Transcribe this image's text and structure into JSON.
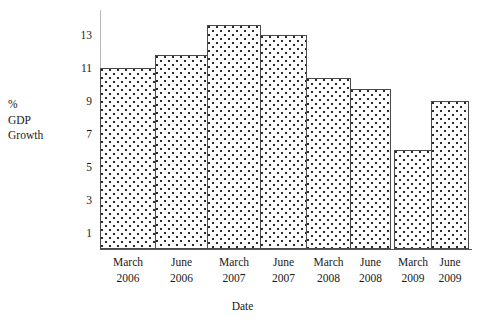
{
  "chart_data": {
    "type": "bar",
    "title": "",
    "xlabel": "Date",
    "ylabel": "% GDP Growth",
    "ylabel_lines": [
      "%",
      "GDP",
      "Growth"
    ],
    "categories": [
      "March 2006",
      "June 2006",
      "March 2007",
      "June 2007",
      "March 2008",
      "June 2008",
      "March 2009",
      "June 2009"
    ],
    "category_lines": [
      [
        "March",
        "2006"
      ],
      [
        "June",
        "2006"
      ],
      [
        "March",
        "2007"
      ],
      [
        "June",
        "2007"
      ],
      [
        "March",
        "2008"
      ],
      [
        "June",
        "2008"
      ],
      [
        "March",
        "2009"
      ],
      [
        "June",
        "2009"
      ]
    ],
    "values": [
      11.0,
      11.8,
      13.6,
      13.0,
      10.4,
      9.7,
      6.0,
      9.0
    ],
    "ytick_labels": [
      "13",
      "11",
      "9",
      "7",
      "5",
      "3",
      "1"
    ],
    "ytick_values": [
      13,
      11,
      9,
      7,
      5,
      3,
      1
    ],
    "ylim": [
      0,
      14.5
    ],
    "grid": false,
    "legend": "none",
    "bar_fill": "#fdfdfd",
    "bar_dot_color": "#2b2b2b",
    "bar_border": "#4a4a4a",
    "axis_color": "#575757"
  }
}
